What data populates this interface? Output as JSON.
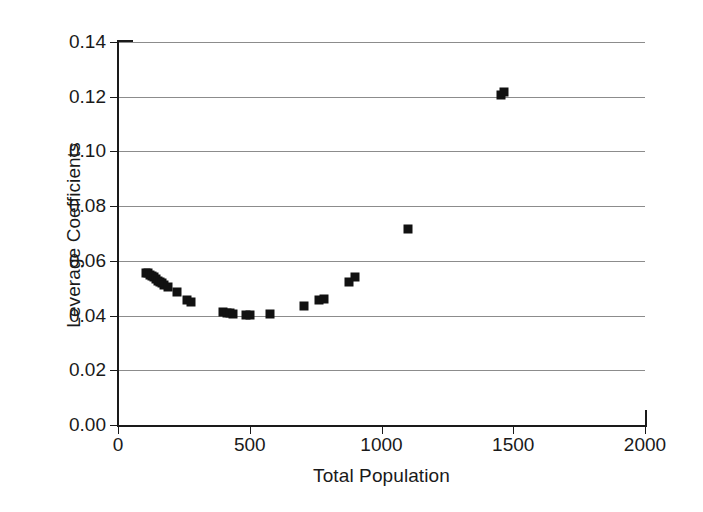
{
  "chart_data": {
    "type": "scatter",
    "title": "",
    "xlabel": "Total Population",
    "ylabel": "Leverage Coefficients",
    "xlim": [
      0,
      2000
    ],
    "ylim": [
      0.0,
      0.14
    ],
    "xticks": [
      0,
      500,
      1000,
      1500,
      2000
    ],
    "xtick_labels": [
      "0",
      "500",
      "1000",
      "1500",
      "2000"
    ],
    "yticks": [
      0.0,
      0.02,
      0.04,
      0.06,
      0.08,
      0.1,
      0.12,
      0.14
    ],
    "ytick_labels": [
      "0.00",
      "0.02",
      "0.04",
      "0.06",
      "0.08",
      "0.10",
      "0.12",
      "0.14"
    ],
    "grid": "horizontal",
    "legend": "none",
    "marker": "filled-square",
    "marker_color": "#111111",
    "series": [
      {
        "name": "Leverage coefficients",
        "points": [
          [
            105,
            0.0556
          ],
          [
            112,
            0.0554
          ],
          [
            120,
            0.055
          ],
          [
            128,
            0.0545
          ],
          [
            136,
            0.054
          ],
          [
            143,
            0.0534
          ],
          [
            150,
            0.0528
          ],
          [
            158,
            0.0523
          ],
          [
            166,
            0.0518
          ],
          [
            176,
            0.0512
          ],
          [
            190,
            0.0506
          ],
          [
            225,
            0.0485
          ],
          [
            262,
            0.0457
          ],
          [
            277,
            0.0449
          ],
          [
            400,
            0.0412
          ],
          [
            413,
            0.041
          ],
          [
            425,
            0.0408
          ],
          [
            437,
            0.0406
          ],
          [
            487,
            0.0402
          ],
          [
            500,
            0.0401
          ],
          [
            575,
            0.0405
          ],
          [
            705,
            0.0435
          ],
          [
            762,
            0.0457
          ],
          [
            780,
            0.0462
          ],
          [
            877,
            0.0521
          ],
          [
            900,
            0.0541
          ],
          [
            1100,
            0.0715
          ],
          [
            1452,
            0.1208
          ],
          [
            1463,
            0.1219
          ]
        ]
      }
    ]
  }
}
